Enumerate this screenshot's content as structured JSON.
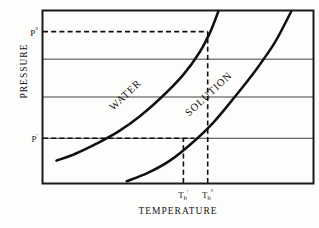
{
  "chart_data": {
    "type": "line",
    "title": "",
    "xlabel": "TEMPERATURE",
    "ylabel": "PRESSURE",
    "xlim": [
      0,
      100
    ],
    "ylim": [
      0,
      100
    ],
    "grid": true,
    "gridlines_y": [
      72,
      50,
      26
    ],
    "legend_position": "inline-on-curve",
    "series": [
      {
        "name": "WATER",
        "label": "WATER",
        "label_rotation_deg": -43,
        "points": [
          {
            "x": 5,
            "y": 13
          },
          {
            "x": 12,
            "y": 17
          },
          {
            "x": 20,
            "y": 23
          },
          {
            "x": 28,
            "y": 30
          },
          {
            "x": 36,
            "y": 39
          },
          {
            "x": 44,
            "y": 50
          },
          {
            "x": 52,
            "y": 63
          },
          {
            "x": 58,
            "y": 76
          },
          {
            "x": 62,
            "y": 88
          },
          {
            "x": 65,
            "y": 100
          }
        ]
      },
      {
        "name": "SOLUTION",
        "label": "SOLUTION",
        "label_rotation_deg": -43,
        "points": [
          {
            "x": 31,
            "y": 1
          },
          {
            "x": 39,
            "y": 6
          },
          {
            "x": 47,
            "y": 13
          },
          {
            "x": 55,
            "y": 23
          },
          {
            "x": 63,
            "y": 35
          },
          {
            "x": 71,
            "y": 50
          },
          {
            "x": 79,
            "y": 66
          },
          {
            "x": 86,
            "y": 82
          },
          {
            "x": 92,
            "y": 100
          }
        ]
      }
    ],
    "annotations": [
      {
        "name": "p-standard-guide",
        "kind": "dashed-horizontal",
        "value_label": "P°",
        "y": 88,
        "from_x": 0,
        "to_x": 61
      },
      {
        "name": "p-prime-guide",
        "kind": "dashed-horizontal",
        "value_label": "P'",
        "y": 26,
        "from_x": 0,
        "to_x": 56
      },
      {
        "name": "tb-prime-guide",
        "kind": "dashed-vertical",
        "value_label": "T'b",
        "x": 52,
        "from_y": 0,
        "to_y": 26
      },
      {
        "name": "tb-standard-guide",
        "kind": "dashed-vertical",
        "value_label": "T°b",
        "x": 61,
        "from_y": 0,
        "to_y": 88
      }
    ],
    "y_tick_labels": [
      {
        "id": "p_standard",
        "text": "P",
        "superscript": "°",
        "y": 88
      },
      {
        "id": "p_prime",
        "text": "P",
        "superscript": "′",
        "y": 26
      }
    ],
    "x_tick_labels": [
      {
        "id": "tb_prime",
        "text": "T",
        "subscript": "b",
        "superscript": "′",
        "x": 52
      },
      {
        "id": "tb_standard",
        "text": "T",
        "subscript": "b",
        "superscript": "°",
        "x": 61
      }
    ],
    "colors": {
      "frame": "#1a1a1a",
      "gridline": "#2a2a2a",
      "curve": "#101010",
      "dashed_guide": "#101010",
      "background": "#fdfdfb"
    }
  },
  "labels": {
    "y_axis_title": "PRESSURE",
    "x_axis_title": "TEMPERATURE",
    "water_curve": "WATER",
    "solution_curve": "SOLUTION",
    "p_standard": "P",
    "p_standard_sup": "°",
    "p_prime": "P",
    "p_prime_sup": "′",
    "tb_prime": "T",
    "tb_prime_sub": "b",
    "tb_prime_sup": "′",
    "tb_standard": "T",
    "tb_standard_sub": "b",
    "tb_standard_sup": "°"
  }
}
